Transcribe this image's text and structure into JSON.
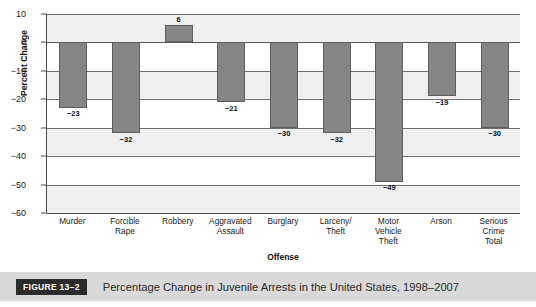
{
  "figure": {
    "badge": "FIGURE 13–2",
    "caption": "Percentage Change in Juvenile Arrests in the United States, 1998–2007"
  },
  "chart_data": {
    "type": "bar",
    "title": "",
    "xlabel": "Offense",
    "ylabel": "Percent Change",
    "ylim": [
      -60,
      10
    ],
    "ytick_values": [
      10,
      0,
      -10,
      -20,
      -30,
      -40,
      -50,
      -60
    ],
    "ytick_labels": [
      "10",
      "0",
      "−10",
      "−20",
      "−30",
      "−40",
      "−50",
      "−60"
    ],
    "grid": true,
    "legend": "none",
    "categories": [
      "Murder",
      "Forcible Rape",
      "Robbery",
      "Aggravated Assault",
      "Burglary",
      "Larceny/ Theft",
      "Motor Vehicle Theft",
      "Arson",
      "Serious Crime Total"
    ],
    "category_lines": [
      [
        "Murder"
      ],
      [
        "Forcible",
        "Rape"
      ],
      [
        "Robbery"
      ],
      [
        "Aggravated",
        "Assault"
      ],
      [
        "Burglary"
      ],
      [
        "Larceny/",
        "Theft"
      ],
      [
        "Motor",
        "Vehicle",
        "Theft"
      ],
      [
        "Arson"
      ],
      [
        "Serious",
        "Crime",
        "Total"
      ]
    ],
    "values": [
      -23,
      -32,
      6,
      -21,
      -30,
      -32,
      -49,
      -19,
      -30
    ],
    "value_labels": [
      "−23",
      "−32",
      "6",
      "−21",
      "−30",
      "−32",
      "−49",
      "−19",
      "−30"
    ],
    "bar_color": "#858585",
    "bar_border_color": "#5e5e5e",
    "band_color": "#efefef",
    "gridline_color": "#6f6f6f"
  }
}
